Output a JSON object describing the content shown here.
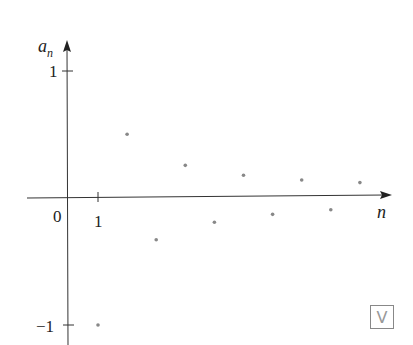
{
  "chart_data": {
    "type": "scatter",
    "title": "",
    "xlabel": "n",
    "ylabel": "a_n",
    "x": [
      1,
      2,
      3,
      4,
      5,
      6,
      7,
      8,
      9,
      10
    ],
    "values": [
      -1,
      0.5,
      -0.333,
      0.25,
      -0.2,
      0.167,
      -0.143,
      0.125,
      -0.111,
      0.1
    ],
    "x_ticks": [
      "0",
      "1"
    ],
    "y_ticks": [
      "1",
      "−1"
    ],
    "ylim": [
      -1,
      1
    ],
    "grid": false,
    "legend": null
  },
  "labels": {
    "y_axis": "a",
    "y_axis_sub": "n",
    "x_axis": "n",
    "origin": "0",
    "x_tick_1": "1",
    "y_tick_pos": "1",
    "y_tick_neg": "−1",
    "badge": "V"
  },
  "colors": {
    "axis": "#333333",
    "point": "#888888"
  }
}
